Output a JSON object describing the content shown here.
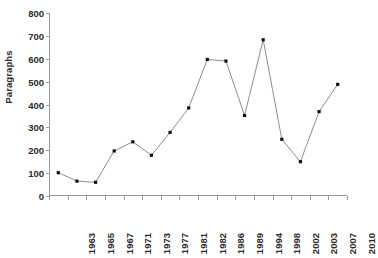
{
  "chart_data": {
    "type": "line",
    "title": "",
    "subtitle": "",
    "xlabel": "",
    "ylabel": "Paragraphs",
    "ylim": [
      0,
      800
    ],
    "ytick_step": 100,
    "yticks": [
      0,
      100,
      200,
      300,
      400,
      500,
      600,
      700,
      800
    ],
    "ytick_labels": [
      "0",
      "100",
      "200",
      "300",
      "400",
      "500",
      "600",
      "700",
      "800"
    ],
    "grid": false,
    "legend": false,
    "legend_position": "none",
    "categories": [
      "1963",
      "1965",
      "1967",
      "1971",
      "1973",
      "1977",
      "1981",
      "1982",
      "1986",
      "1989",
      "1994",
      "1998",
      "2002",
      "2003",
      "2007",
      "2010"
    ],
    "values": [
      102,
      65,
      60,
      197,
      237,
      178,
      278,
      385,
      597,
      590,
      352,
      683,
      248,
      150,
      369,
      488
    ],
    "series": [
      {
        "name": "Paragraphs",
        "values": [
          102,
          65,
          60,
          197,
          237,
          178,
          278,
          385,
          597,
          590,
          352,
          683,
          248,
          150,
          369,
          488
        ]
      }
    ],
    "marker": "square",
    "line_color": "#808080",
    "marker_color": "#111111",
    "axis_color": "#9a9a9a",
    "background_color": "#ffffff",
    "text_color": "#2b2b2b"
  }
}
